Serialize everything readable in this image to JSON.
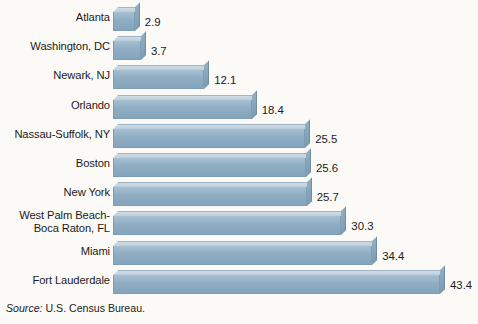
{
  "chart_data": {
    "type": "bar",
    "orientation": "horizontal",
    "title": "",
    "subtitle": "",
    "xlabel": "",
    "ylabel": "",
    "grid": false,
    "legend": null,
    "xlim": [
      0,
      43.4
    ],
    "categories": [
      "Atlanta",
      "Washington, DC",
      "Newark, NJ",
      "Orlando",
      "Nassau-Suffolk, NY",
      "Boston",
      "New York",
      "West Palm Beach-\nBoca Raton, FL",
      "Miami",
      "Fort Lauderdale"
    ],
    "values": [
      2.9,
      3.7,
      12.1,
      18.4,
      25.5,
      25.6,
      25.7,
      30.3,
      34.4,
      43.4
    ],
    "value_labels": [
      "2.9",
      "3.7",
      "12.1",
      "18.4",
      "25.5",
      "25.6",
      "25.7",
      "30.3",
      "34.4",
      "43.4"
    ]
  },
  "rows": [
    {
      "label_line1": "Atlanta",
      "label_line2": "",
      "value": "2.9"
    },
    {
      "label_line1": "Washington, DC",
      "label_line2": "",
      "value": "3.7"
    },
    {
      "label_line1": "Newark, NJ",
      "label_line2": "",
      "value": "12.1"
    },
    {
      "label_line1": "Orlando",
      "label_line2": "",
      "value": "18.4"
    },
    {
      "label_line1": "Nassau-Suffolk, NY",
      "label_line2": "",
      "value": "25.5"
    },
    {
      "label_line1": "Boston",
      "label_line2": "",
      "value": "25.6"
    },
    {
      "label_line1": "New York",
      "label_line2": "",
      "value": "25.7"
    },
    {
      "label_line1": "West Palm Beach-",
      "label_line2": "Boca Raton, FL",
      "value": "30.3"
    },
    {
      "label_line1": "Miami",
      "label_line2": "",
      "value": "34.4"
    },
    {
      "label_line1": "Fort Lauderdale",
      "label_line2": "",
      "value": "43.4"
    }
  ],
  "source": {
    "prefix": "Source:",
    "text": "U.S. Census Bureau."
  },
  "colors": {
    "background": "#fbfaf7",
    "bar_front": "#8fadc3",
    "bar_top": "#c4d4e0",
    "bar_side": "#87a4ba",
    "bar_outline": "#7e9db4",
    "text": "#1b1b1b"
  }
}
